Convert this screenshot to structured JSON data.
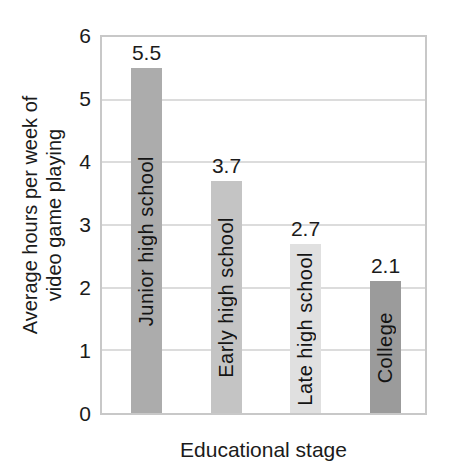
{
  "chart_data": {
    "type": "bar",
    "title": "",
    "xlabel": "Educational stage",
    "ylabel": "Average hours per week of video game playing",
    "ylabel_lines": [
      "Average hours per week of",
      "video game playing"
    ],
    "categories": [
      "Junior high school",
      "Early high school",
      "Late high school",
      "College"
    ],
    "values": [
      5.5,
      3.7,
      2.7,
      2.1
    ],
    "value_labels": [
      "5.5",
      "3.7",
      "2.7",
      "2.1"
    ],
    "bar_colors": [
      "#acacac",
      "#c4c4c4",
      "#e0e0e0",
      "#9b9b9b"
    ],
    "ylim": [
      0,
      6
    ],
    "yticks": [
      "0",
      "1",
      "2",
      "3",
      "4",
      "5",
      "6"
    ],
    "grid": "horizontal",
    "legend": "none"
  },
  "style": {
    "grid_color": "#dcdcdc",
    "plot_border_color": "#c8c8c8",
    "text_color": "#1b1b1b",
    "background": "#ffffff"
  }
}
